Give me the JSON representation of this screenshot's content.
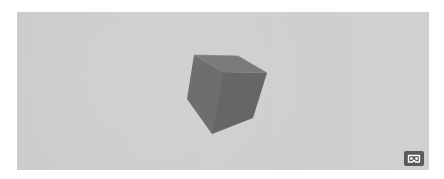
{
  "viewport": {
    "background_color": "#cfcfcf",
    "object": "cube",
    "cube": {
      "top_face_color": "#7a7a7a",
      "left_face_color": "#6f6f6f",
      "right_face_color": "#666666"
    }
  },
  "vr_button": {
    "icon": "vr-headset-icon",
    "background_color": "#5a5a5a",
    "icon_color": "#ffffff"
  }
}
